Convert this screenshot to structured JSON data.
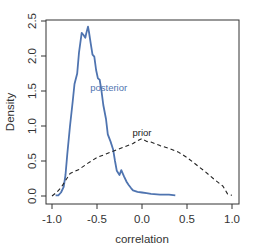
{
  "chart_data": {
    "type": "line",
    "title": "",
    "xlabel": "correlation",
    "ylabel": "Density",
    "xlim": [
      -1.08,
      1.08
    ],
    "ylim": [
      -0.1,
      2.6
    ],
    "grid": false,
    "legend": null,
    "x_ticks": [
      -1.0,
      -0.5,
      0.0,
      0.5,
      1.0
    ],
    "x_tick_labels": [
      "-1.0",
      "-0.5",
      "0.0",
      "0.5",
      "1.0"
    ],
    "y_ticks": [
      0.0,
      0.5,
      1.0,
      1.5,
      2.0,
      2.5
    ],
    "y_tick_labels": [
      "0.0",
      "0.5",
      "1.0",
      "1.5",
      "2.0",
      "2.5"
    ],
    "series": [
      {
        "name": "posterior",
        "color": "#4f74b0",
        "style": "solid",
        "label_pos": {
          "x": -0.37,
          "y": 1.5
        },
        "x": [
          -0.96,
          -0.93,
          -0.9,
          -0.87,
          -0.85,
          -0.83,
          -0.8,
          -0.77,
          -0.75,
          -0.72,
          -0.7,
          -0.67,
          -0.65,
          -0.63,
          -0.62,
          -0.6,
          -0.59,
          -0.57,
          -0.55,
          -0.53,
          -0.51,
          -0.49,
          -0.47,
          -0.45,
          -0.43,
          -0.4,
          -0.38,
          -0.35,
          -0.32,
          -0.3,
          -0.28,
          -0.25,
          -0.23,
          -0.2,
          -0.17,
          -0.15,
          -0.12,
          -0.1,
          -0.05,
          0.0,
          0.05,
          0.1,
          0.2,
          0.3,
          0.37
        ],
        "y": [
          0.01,
          0.01,
          0.05,
          0.13,
          0.3,
          0.6,
          1.0,
          1.35,
          1.6,
          1.75,
          2.05,
          2.33,
          2.3,
          2.26,
          2.32,
          2.42,
          2.35,
          2.18,
          2.02,
          1.99,
          1.8,
          1.68,
          1.66,
          1.5,
          1.3,
          1.1,
          0.88,
          0.78,
          0.66,
          0.5,
          0.36,
          0.3,
          0.37,
          0.28,
          0.2,
          0.16,
          0.11,
          0.08,
          0.06,
          0.05,
          0.04,
          0.03,
          0.02,
          0.02,
          0.01
        ]
      },
      {
        "name": "prior",
        "color": "#222222",
        "style": "dashed",
        "label_pos": {
          "x": 0.0,
          "y": 0.86
        },
        "x": [
          -1.0,
          -0.95,
          -0.9,
          -0.85,
          -0.8,
          -0.7,
          -0.6,
          -0.5,
          -0.4,
          -0.3,
          -0.2,
          -0.1,
          -0.05,
          0.0,
          0.05,
          0.1,
          0.2,
          0.3,
          0.4,
          0.5,
          0.6,
          0.7,
          0.8,
          0.9,
          0.95,
          1.0
        ],
        "y": [
          0.0,
          0.05,
          0.12,
          0.22,
          0.32,
          0.38,
          0.47,
          0.55,
          0.6,
          0.65,
          0.7,
          0.75,
          0.79,
          0.82,
          0.78,
          0.77,
          0.72,
          0.68,
          0.63,
          0.55,
          0.45,
          0.35,
          0.24,
          0.14,
          0.03,
          0.01
        ]
      }
    ]
  }
}
